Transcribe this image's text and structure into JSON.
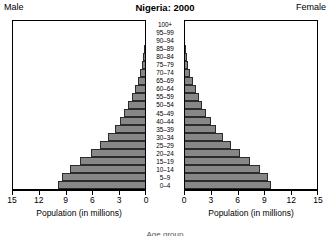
{
  "header": {
    "male_label": "Male",
    "title": "Nigeria: 2000",
    "female_label": "Female"
  },
  "footer": {
    "caption": "Age group"
  },
  "axis": {
    "title": "Population (in millions)",
    "ticks_male": [
      "15",
      "12",
      "9",
      "6",
      "3",
      "0"
    ],
    "ticks_female": [
      "0",
      "3",
      "6",
      "9",
      "12",
      "15"
    ],
    "min": 0,
    "max": 15
  },
  "style": {
    "bar_fill": "#878787",
    "bar_stroke": "#2b2b2b",
    "axis_color": "#000000",
    "background": "#ffffff"
  },
  "chart_data": {
    "type": "bar",
    "subtype": "population-pyramid",
    "title": "Nigeria: 2000",
    "xlabel": "Population (in millions)",
    "ylabel": "Age group",
    "xlim": [
      0,
      15
    ],
    "xticks": [
      0,
      3,
      6,
      9,
      12,
      15
    ],
    "grid": false,
    "legend": [
      "Male",
      "Female"
    ],
    "legend_position": "top-corners",
    "orientation": "horizontal-mirrored",
    "note": "Left panel (Male) has a reversed x axis running 15 -> 0; right panel (Female) runs 0 -> 15. Categories listed top (oldest) to bottom (youngest) as drawn.",
    "categories": [
      "100+",
      "95–99",
      "90–94",
      "85–89",
      "80–84",
      "75–79",
      "70–74",
      "65–69",
      "60–64",
      "55–59",
      "50–54",
      "45–49",
      "40–44",
      "35–39",
      "30–34",
      "25–29",
      "20–24",
      "15–19",
      "10–14",
      "5–9",
      "0–4"
    ],
    "series": [
      {
        "name": "Male",
        "values": [
          0.02,
          0.05,
          0.1,
          0.18,
          0.3,
          0.46,
          0.68,
          0.95,
          1.25,
          1.6,
          2.0,
          2.45,
          2.95,
          3.55,
          4.3,
          5.2,
          6.25,
          7.45,
          8.6,
          9.55,
          9.95
        ]
      },
      {
        "name": "Female",
        "values": [
          0.02,
          0.05,
          0.11,
          0.2,
          0.33,
          0.5,
          0.73,
          1.0,
          1.32,
          1.68,
          2.08,
          2.55,
          3.05,
          3.65,
          4.4,
          5.3,
          6.35,
          7.5,
          8.6,
          9.5,
          9.85
        ]
      }
    ]
  }
}
